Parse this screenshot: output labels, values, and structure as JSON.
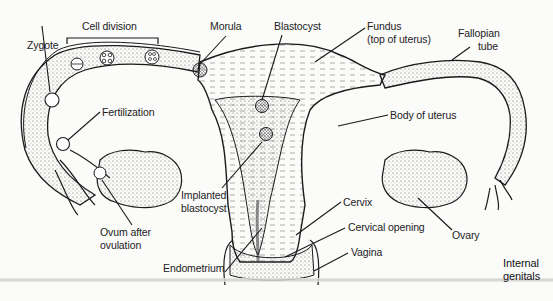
{
  "diagram": {
    "labels": {
      "cell_division": "Cell division",
      "zygote": "Zygote",
      "morula": "Morula",
      "blastocyst": "Blastocyst",
      "fundus_line1": "Fundus",
      "fundus_line2": "(top of uterus)",
      "fallopian_line1": "Fallopian",
      "fallopian_line2": "tube",
      "fertilization": "Fertilization",
      "body_of_uterus": "Body of uterus",
      "implanted_line1": "Implanted",
      "implanted_line2": "blastocyst",
      "ovum_line1": "Ovum after",
      "ovum_line2": "ovulation",
      "cervix": "Cervix",
      "cervical_opening": "Cervical opening",
      "ovary": "Ovary",
      "vagina": "Vagina",
      "endometrium": "Endometrium",
      "internal_line1": "Internal",
      "internal_line2": "genitals"
    },
    "colors": {
      "background": "#fbfbfa",
      "ink": "#1a1a1a",
      "stipple": "#555555"
    }
  }
}
